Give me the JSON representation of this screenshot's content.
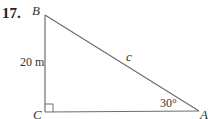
{
  "problem_number": "17.",
  "diagram": {
    "type": "right-triangle",
    "vertices": {
      "B": {
        "label": "B"
      },
      "C": {
        "label": "C"
      },
      "A": {
        "label": "A"
      }
    },
    "side_labels": {
      "BC": "20 m",
      "AB": "c"
    },
    "angle_labels": {
      "A": "30°"
    },
    "right_angle_at": "C",
    "line_color": "#6e6e6e"
  }
}
